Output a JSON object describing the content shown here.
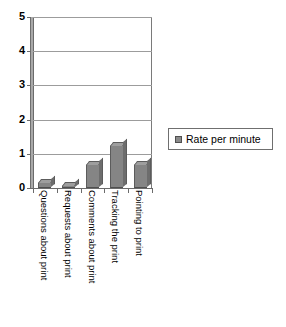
{
  "chart_data": {
    "type": "bar",
    "title": "",
    "subtitle": "",
    "xlabel": "",
    "ylabel": "",
    "ylim": [
      0,
      5
    ],
    "ytick_labels": [
      "5",
      "4",
      "3",
      "2",
      "1",
      "0"
    ],
    "ytick_values": [
      5,
      4,
      3,
      2,
      1,
      0
    ],
    "grid": true,
    "grid_axis": "y",
    "legend_position": "right",
    "categories": [
      "Questions about print",
      "Requests about print",
      "Comments about print",
      "Tracking the print",
      "Pointing to print"
    ],
    "series": [
      {
        "name": "Rate per minute",
        "values": [
          0.15,
          0.07,
          0.68,
          1.22,
          0.68
        ],
        "color": "#858585"
      }
    ],
    "annotations": [],
    "style": "excel-3d-column"
  },
  "legend": {
    "entries": [
      {
        "label": "Rate per minute",
        "swatch_color": "#858585"
      }
    ]
  },
  "axes": {
    "y_ticks": [
      {
        "label": "5",
        "value": 5
      },
      {
        "label": "4",
        "value": 4
      },
      {
        "label": "3",
        "value": 3
      },
      {
        "label": "2",
        "value": 2
      },
      {
        "label": "1",
        "value": 1
      },
      {
        "label": "0",
        "value": 0
      }
    ],
    "x_categories": [
      {
        "label": "Questions about print"
      },
      {
        "label": "Requests about print"
      },
      {
        "label": "Comments about print"
      },
      {
        "label": "Tracking the print"
      },
      {
        "label": "Pointing to print"
      }
    ]
  },
  "colors": {
    "bar_face": "#858585",
    "bar_top": "#9e9e9e",
    "bar_side": "#6d6d6d",
    "bar_edge": "#5c5c5c",
    "gridline": "#9c9c9c",
    "axis": "#6b6b6b",
    "wall": "#a9a9a9",
    "text": "#000000",
    "background": "#ffffff"
  }
}
